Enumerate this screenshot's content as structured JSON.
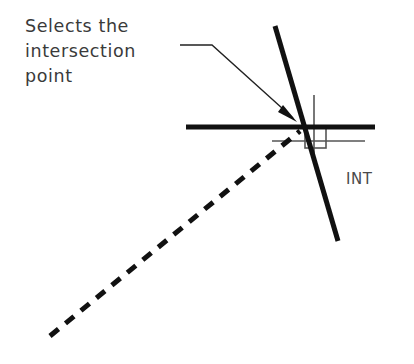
{
  "diagram": {
    "title_note": "CAD intersection object snap illustration",
    "annotation": {
      "lines": [
        "Selects the",
        "intersection",
        "point"
      ],
      "text": "Selects the\nintersection\npoint"
    },
    "snap_label": "INT",
    "colors": {
      "ink": "#111111",
      "text": "#3a3a3a",
      "crosshair": "#555555",
      "background": "#ffffff"
    },
    "geometry": {
      "intersection_point": {
        "x": 302,
        "y": 128
      },
      "horizontal_line": {
        "x1": 186,
        "y1": 127,
        "x2": 375,
        "y2": 127,
        "width": 5
      },
      "steep_diagonal_line": {
        "x1": 275,
        "y1": 26,
        "x2": 338,
        "y2": 241,
        "width": 5
      },
      "dashed_diagonal_line": {
        "x1": 50,
        "y1": 336,
        "x2": 300,
        "y2": 131,
        "width": 5,
        "dash": "11 9"
      },
      "leader": {
        "start": {
          "x": 180,
          "y": 45
        },
        "bend": {
          "x": 212,
          "y": 45
        },
        "arrow_tip": {
          "x": 297,
          "y": 122
        }
      },
      "crosshair": {
        "vertical": {
          "x": 314,
          "y1": 95,
          "y2": 154
        },
        "horizontal": {
          "y": 141,
          "x1": 272,
          "x2": 365
        }
      },
      "pick_box": {
        "x": 305,
        "y": 127,
        "size": 21
      }
    }
  }
}
